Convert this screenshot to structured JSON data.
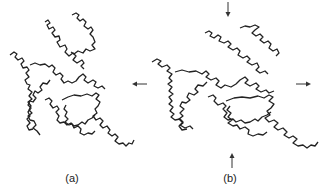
{
  "figure": {
    "panels": [
      {
        "id": "a",
        "label": "(a)",
        "description": "Fractal curve (original)"
      },
      {
        "id": "b",
        "label": "(b)",
        "description": "Fractal curve stretched horizontally with arrows indicating deformation"
      }
    ],
    "arrows": [
      {
        "direction": "down",
        "panel": "b"
      },
      {
        "direction": "left",
        "panel": "b"
      },
      {
        "direction": "right",
        "panel": "b"
      },
      {
        "direction": "up",
        "panel": "b"
      }
    ],
    "colors": {
      "ink": "#222222",
      "background": "#ffffff"
    }
  }
}
